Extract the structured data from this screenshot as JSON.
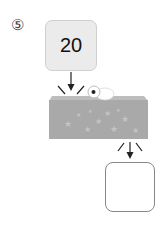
{
  "problem": {
    "number_label": "⑤",
    "input_value": "20",
    "output_value": ""
  },
  "machine": {
    "description": "function machine box with stars",
    "body_color": "#a9a9a9",
    "top_color": "#bdbdbd",
    "star_color": "#c4c4c4"
  },
  "colors": {
    "input_box_fill": "#ebebeb",
    "output_box_border": "#888888",
    "arrow": "#222222"
  }
}
